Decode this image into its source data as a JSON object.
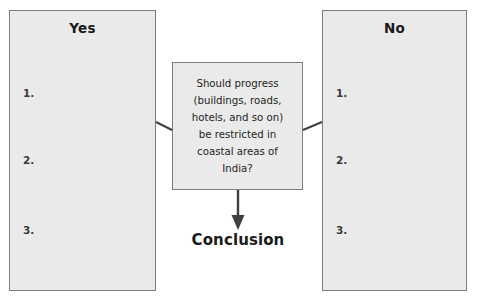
{
  "diagram": {
    "colors": {
      "box_fill": "#eaeaea",
      "box_border": "#7d7d7d",
      "connector": "#3f3f3f",
      "text": "#231f20",
      "page_background": "#ffffff"
    },
    "question_box": {
      "name": "question",
      "lines": [
        "Should progress",
        "(buildings, roads,",
        "hotels, and so on)",
        "be restricted in",
        "coastal areas of",
        "India?"
      ],
      "full_text": "Should progress (buildings, roads, hotels, and so on) be restricted in coastal areas of India?"
    },
    "options": [
      {
        "id": "yes",
        "title": "Yes",
        "slots": [
          "1.",
          "2.",
          "3."
        ]
      },
      {
        "id": "no",
        "title": "No",
        "slots": [
          "1.",
          "2.",
          "3."
        ]
      }
    ],
    "conclusion": {
      "label": "Conclusion"
    },
    "connectors": [
      {
        "from": "box-yes",
        "to": "question",
        "style": "line"
      },
      {
        "from": "question",
        "to": "box-no",
        "style": "line"
      },
      {
        "from": "question",
        "to": "conclusion",
        "style": "arrow-down"
      }
    ]
  }
}
